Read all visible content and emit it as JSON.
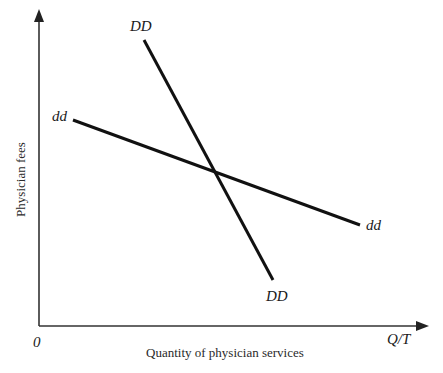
{
  "figure": {
    "y_axis_label": "Physician fees",
    "x_axis_label": "Quantity of physician services",
    "origin_label": "0",
    "x_axis_end_label": "Q/T"
  },
  "curves": [
    {
      "name": "DD",
      "description": "Market demand curve (steep)",
      "label_top": "DD",
      "label_bottom": "DD",
      "start": [
        144,
        40
      ],
      "end": [
        273,
        280
      ]
    },
    {
      "name": "dd",
      "description": "Individual physician demand curve (flatter)",
      "label_left": "dd",
      "label_right": "dd",
      "start": [
        73,
        120
      ],
      "end": [
        360,
        225
      ]
    }
  ],
  "intersection": [
    215,
    172
  ],
  "colors": {
    "line": "#111111",
    "axis": "#333333",
    "text": "#1a1a1a",
    "background": "#ffffff"
  }
}
